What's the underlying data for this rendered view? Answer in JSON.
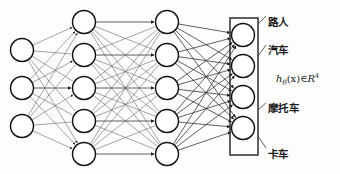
{
  "diagram": {
    "layers": [
      {
        "name": "input-layer",
        "node_count": 3,
        "cx": 22,
        "ys": [
          50,
          88,
          126
        ]
      },
      {
        "name": "hidden-layer-1",
        "node_count": 5,
        "cx": 84,
        "ys": [
          22,
          55,
          88,
          121,
          154
        ]
      },
      {
        "name": "hidden-layer-2",
        "node_count": 5,
        "cx": 167,
        "ys": [
          22,
          55,
          88,
          121,
          154
        ]
      },
      {
        "name": "output-layer",
        "node_count": 4,
        "cx": 243,
        "ys": [
          35,
          66,
          97,
          128
        ]
      }
    ],
    "node_radius": 11.5,
    "output_box": {
      "x": 230,
      "y": 18,
      "width": 28,
      "height": 137
    },
    "colors": {
      "node_stroke": "#111111",
      "node_fill": "#ffffff",
      "edge": "#5a5a5a",
      "box_stroke": "#2b2b2b",
      "text": "#1a1a1a",
      "background": "#fdfdfd"
    },
    "output_labels": [
      {
        "name": "output-label-pedestrian",
        "text": "路人",
        "x": 268,
        "y": 14,
        "leader_from": [
          258,
          24
        ],
        "leader_to": [
          266,
          16
        ]
      },
      {
        "name": "output-label-car",
        "text": "汽车",
        "x": 268,
        "y": 42,
        "leader_from": [
          258,
          56
        ],
        "leader_to": [
          266,
          45
        ]
      },
      {
        "name": "output-label-motorcycle",
        "text": "摩托车",
        "x": 268,
        "y": 100,
        "leader_from": [
          258,
          110
        ],
        "leader_to": [
          266,
          103
        ]
      },
      {
        "name": "output-label-truck",
        "text": "卡车",
        "x": 268,
        "y": 146,
        "leader_from": [
          258,
          136
        ],
        "leader_to": [
          266,
          148
        ]
      }
    ],
    "formula": {
      "name": "hypothesis-formula",
      "h": "h",
      "theta": "θ",
      "arg": "(x)",
      "member": "∈",
      "space": "R",
      "dim": "4",
      "x": 276,
      "y": 72
    }
  }
}
